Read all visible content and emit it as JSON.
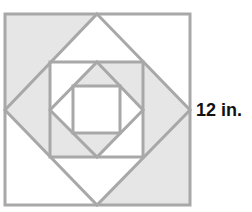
{
  "figure": {
    "label": "12 in.",
    "colors": {
      "line": "#a8a8a8",
      "shade": "#e6e6e6",
      "background": "#ffffff",
      "text": "#111111"
    },
    "shapes": {
      "outer_square": {
        "x1": 5,
        "y1": 14,
        "x2": 190,
        "y2": 205
      },
      "diamond_1": {
        "top": [
          97,
          14
        ],
        "right": [
          190,
          110
        ],
        "bottom": [
          97,
          205
        ],
        "left": [
          5,
          110
        ]
      },
      "square_2": {
        "x1": 50,
        "y1": 62,
        "x2": 143,
        "y2": 157
      },
      "diamond_2": {
        "top": [
          97,
          62
        ],
        "right": [
          143,
          110
        ],
        "bottom": [
          97,
          157
        ],
        "left": [
          50,
          110
        ]
      },
      "square_3": {
        "x1": 73,
        "y1": 86,
        "x2": 120,
        "y2": 133
      }
    },
    "shaded_regions": [
      "outer-top-left-corner",
      "outer-bottom-right-corner",
      "diamond1-left-triangle",
      "diamond1-right-triangle",
      "square2-top-right-corner",
      "square2-bottom-left-corner",
      "diamond2-top-triangle",
      "diamond2-bottom-triangle"
    ]
  }
}
